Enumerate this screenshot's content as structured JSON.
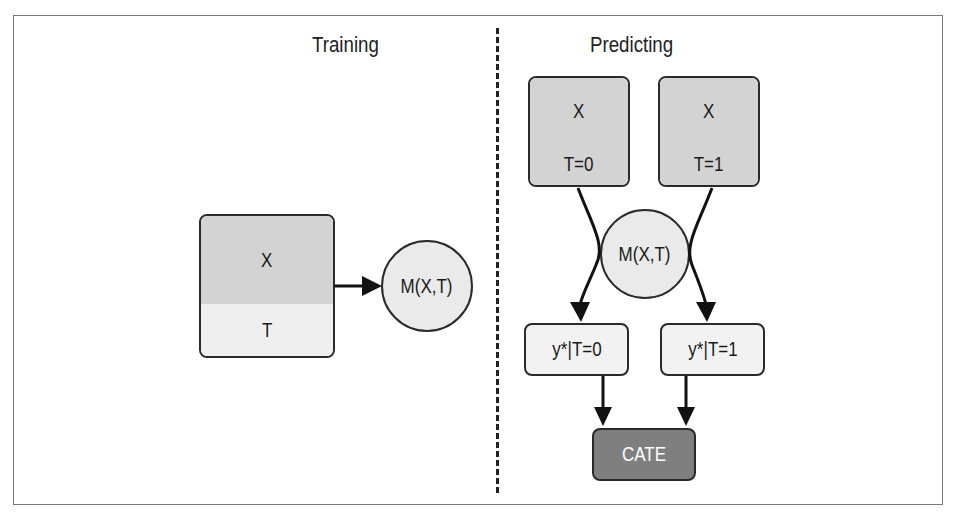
{
  "training": {
    "title": "Training",
    "input_box": {
      "top_label": "X",
      "bottom_label": "T"
    },
    "model": "M(X,T)"
  },
  "predicting": {
    "title": "Predicting",
    "input_boxes": [
      {
        "top_label": "X",
        "bottom_label": "T=0"
      },
      {
        "top_label": "X",
        "bottom_label": "T=1"
      }
    ],
    "model": "M(X,T)",
    "outputs": [
      "y*|T=0",
      "y*|T=1"
    ],
    "result": "CATE"
  },
  "colors": {
    "feature_fill": "#d3d3d3",
    "treatment_fill_training": "#efefef",
    "treatment_fill_predicting": "#d3d3d3",
    "model_fill": "#eaeaea",
    "output_fill": "#f2f2f2",
    "result_fill": "#7f7f7f",
    "stroke": "#2a2a2a"
  }
}
